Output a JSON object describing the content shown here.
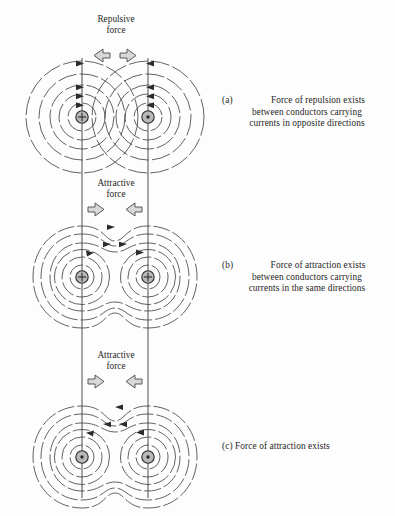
{
  "figure": {
    "background_color": "#fdfdfd",
    "line_color": "#333333",
    "arrow_fill": "#d8d8d8",
    "arrow_stroke": "#4a4a4a",
    "conductor_fill": "#b8b8b8"
  },
  "sections": [
    {
      "id": "a",
      "tag": "(a)",
      "force_label_line1": "Repulsive",
      "force_label_line2": "force",
      "force_direction": "outward",
      "caption_line1": "Force of repulsion exists",
      "caption_line2": "between conductors carrying",
      "caption_line3": "currents in opposite directions",
      "left_conductor_symbol": "cross",
      "right_conductor_symbol": "dot",
      "field_shape": "separate-concentric",
      "center_y": 117,
      "left_cx": 82,
      "right_cx": 148
    },
    {
      "id": "b",
      "tag": "(b)",
      "force_label_line1": "Attractive",
      "force_label_line2": "force",
      "force_direction": "inward",
      "caption_line1": "Force of attraction exists",
      "caption_line2": "between conductors carrying",
      "caption_line3": "currents in the same directions",
      "left_conductor_symbol": "cross",
      "right_conductor_symbol": "cross",
      "field_shape": "merged-peanut",
      "center_y": 277,
      "left_cx": 82,
      "right_cx": 148
    },
    {
      "id": "c",
      "tag": "(c)",
      "force_label_line1": "Attractive",
      "force_label_line2": "force",
      "force_direction": "inward",
      "caption_line1": "Force of attraction exists",
      "caption_line2": "",
      "caption_line3": "",
      "left_conductor_symbol": "dot",
      "right_conductor_symbol": "dot",
      "field_shape": "merged-peanut",
      "center_y": 457,
      "left_cx": 82,
      "right_cx": 148
    }
  ]
}
